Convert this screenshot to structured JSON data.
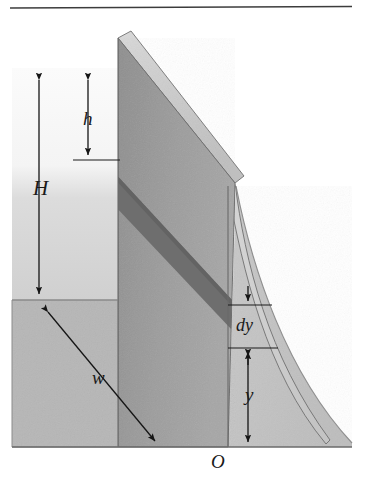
{
  "figure": {
    "type": "physics-diagram",
    "background_color": "#ffffff",
    "top_rule": {
      "color": "#3c3c3c",
      "x1": 10,
      "y1": 8,
      "x2": 352,
      "y2": 7
    },
    "colors": {
      "water_top": "#f2f2f2",
      "water_bottom": "#d2d2d2",
      "ground": "#b6b6b6",
      "dam_front_face": "#9a9a9a",
      "dam_top_bevel": "#c9c9c9",
      "dam_right_face": "#cfcfcf",
      "dam_strip_dark": "#6e6e6e",
      "downstream_shade": "#c2c2c2",
      "outline": "#4a4a4a",
      "label_ink": "#1a1a1a"
    },
    "labels": [
      {
        "id": "H",
        "text": "H",
        "meaning": "total-water-depth",
        "x": 33,
        "y": 178
      },
      {
        "id": "h",
        "text": "h",
        "meaning": "depth-below-surface",
        "x": 83,
        "y": 109
      },
      {
        "id": "w",
        "text": "w",
        "meaning": "dam-width",
        "x": 92,
        "y": 368
      },
      {
        "id": "dy",
        "text": "dy",
        "meaning": "differential-strip-height",
        "x": 236,
        "y": 316
      },
      {
        "id": "y",
        "text": "y",
        "meaning": "height-above-origin",
        "x": 245,
        "y": 385
      },
      {
        "id": "O",
        "text": "O",
        "meaning": "origin-point",
        "x": 211,
        "y": 452
      }
    ],
    "dimension_arrows": [
      {
        "id": "H-arrow",
        "style": "double-headed-vertical",
        "x": 39,
        "y_top": 74,
        "y_bottom": 299
      },
      {
        "id": "h-arrow",
        "style": "double-headed-vertical",
        "x": 88,
        "y_top": 74,
        "y_bottom": 160
      },
      {
        "id": "w-arrow",
        "style": "double-headed-diagonal",
        "x1": 44,
        "y1": 307,
        "x2": 159,
        "y2": 446
      },
      {
        "id": "dy-arrow",
        "style": "double-headed-vertical",
        "x": 248,
        "y_top": 281,
        "y_bottom": 348
      },
      {
        "id": "y-arrow",
        "style": "double-headed-vertical",
        "x": 248,
        "y_top": 349,
        "y_bottom": 447
      }
    ],
    "leader_lines": [
      {
        "id": "h-level-tick",
        "x1": 73,
        "y1": 160,
        "x2": 120,
        "y2": 160
      },
      {
        "id": "dy-top-tick",
        "x1": 228,
        "y1": 305,
        "x2": 272,
        "y2": 305
      },
      {
        "id": "dy-bottom-tick",
        "x1": 228,
        "y1": 348,
        "x2": 278,
        "y2": 348
      }
    ],
    "geometry": {
      "dam_apex": [
        118,
        38
      ],
      "dam_front_bottom_left": [
        118,
        447
      ],
      "dam_front_bottom_right": [
        228,
        447
      ],
      "dam_front_top_right": [
        228,
        186
      ],
      "top_bevel_far": [
        235,
        183
      ],
      "ground_line_y": 447,
      "water_surface_y": 300,
      "water_left_x": 12,
      "strip_band_left_y": 175,
      "strip_band_right_y": 305
    }
  }
}
